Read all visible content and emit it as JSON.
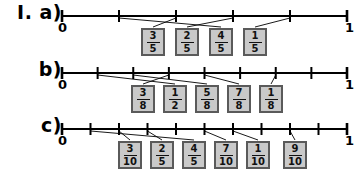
{
  "worksheet": {
    "title_label": "I.",
    "background_color": "#ffffff",
    "line_color": "#000000",
    "box_fill_color": "#c9c9c9",
    "box_border_color": "#5a5a5a"
  },
  "rows": [
    {
      "id": "a",
      "label": "I. a)",
      "start_label": "0",
      "end_label": "1",
      "denominator": 5,
      "tick_count": 6,
      "boxes": [
        {
          "numerator": "3",
          "denominator": "5"
        },
        {
          "numerator": "2",
          "denominator": "5"
        },
        {
          "numerator": "4",
          "denominator": "5"
        },
        {
          "numerator": "1",
          "denominator": "5"
        }
      ]
    },
    {
      "id": "b",
      "label": "b)",
      "start_label": "0",
      "end_label": "1",
      "denominator": 8,
      "tick_count": 9,
      "boxes": [
        {
          "numerator": "3",
          "denominator": "8"
        },
        {
          "numerator": "1",
          "denominator": "2"
        },
        {
          "numerator": "5",
          "denominator": "8"
        },
        {
          "numerator": "7",
          "denominator": "8"
        },
        {
          "numerator": "1",
          "denominator": "8"
        }
      ]
    },
    {
      "id": "c",
      "label": "c)",
      "start_label": "0",
      "end_label": "1",
      "denominator": 10,
      "tick_count": 11,
      "boxes": [
        {
          "numerator": "3",
          "denominator": "10"
        },
        {
          "numerator": "2",
          "denominator": "5"
        },
        {
          "numerator": "4",
          "denominator": "5"
        },
        {
          "numerator": "7",
          "denominator": "10"
        },
        {
          "numerator": "1",
          "denominator": "10"
        },
        {
          "numerator": "9",
          "denominator": "10"
        }
      ]
    }
  ]
}
